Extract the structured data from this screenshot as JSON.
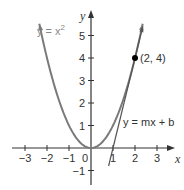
{
  "chart_data": {
    "type": "line",
    "title": "",
    "xlabel": "x",
    "ylabel": "y",
    "xlim": [
      -3.5,
      3.8
    ],
    "ylim": [
      -1.6,
      5.9
    ],
    "x_ticks": [
      -3,
      -2,
      -1,
      0,
      1,
      2,
      3
    ],
    "y_ticks": [
      -1,
      1,
      2,
      3,
      4,
      5
    ],
    "x_tick_labels": [
      "−3",
      "−2",
      "−1",
      "0",
      "1",
      "2",
      "3"
    ],
    "y_tick_labels": [
      "−1",
      "1",
      "2",
      "3",
      "4",
      "5"
    ],
    "grid": false,
    "series": [
      {
        "name": "y = x²",
        "kind": "parabola",
        "a": 1,
        "x_range": [
          -2.35,
          2.35
        ],
        "color": "#7a7a7a"
      },
      {
        "name": "y = mx + b",
        "kind": "line",
        "slope": 4,
        "intercept": -4,
        "x_range": [
          0.8,
          2.35
        ],
        "color": "#555555"
      }
    ],
    "points": [
      {
        "x": 2,
        "y": 4,
        "label": "(2, 4)"
      }
    ],
    "annotations": [
      {
        "text": "y = x",
        "sup": "2",
        "near": "upper-left"
      },
      {
        "text": "y = mx + b",
        "near": "lower-right"
      }
    ],
    "colors": {
      "axis": "#333333",
      "parabola": "#7a7a7a",
      "tangent": "#555555",
      "point": "#000000"
    }
  }
}
